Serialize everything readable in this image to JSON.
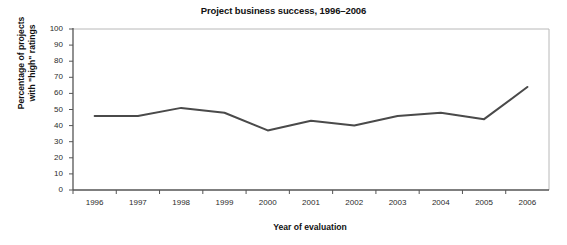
{
  "chart_data": {
    "type": "line",
    "title": "Project business success, 1996–2006",
    "xlabel": "Year of evaluation",
    "ylabel": "Percentage of projects\nwith \"high\" ratings",
    "x": [
      1996,
      1997,
      1998,
      1999,
      2000,
      2001,
      2002,
      2003,
      2004,
      2005,
      2006
    ],
    "categories": [
      "1996",
      "1997",
      "1998",
      "1999",
      "2000",
      "2001",
      "2002",
      "2003",
      "2004",
      "2005",
      "2006"
    ],
    "values": [
      46,
      46,
      51,
      48,
      37,
      43,
      40,
      46,
      48,
      44,
      64
    ],
    "series": [
      {
        "name": "Percentage of projects with \"high\" ratings",
        "values": [
          46,
          46,
          51,
          48,
          37,
          43,
          40,
          46,
          48,
          44,
          64
        ]
      }
    ],
    "ylim": [
      0,
      100
    ],
    "ytick_values": [
      0,
      10,
      20,
      30,
      40,
      50,
      60,
      70,
      80,
      90,
      100
    ],
    "ytick_labels": [
      "0",
      "10",
      "20",
      "30",
      "40",
      "50",
      "60",
      "70",
      "80",
      "90",
      "100"
    ],
    "xtick_labels": [
      "1996",
      "1997",
      "1998",
      "1999",
      "2000",
      "2001",
      "2002",
      "2003",
      "2004",
      "2005",
      "2006"
    ],
    "grid": false,
    "legend": null,
    "legend_position": "none",
    "line_color": "#4a4a4a",
    "line_width": 2,
    "axis_color": "#555555",
    "frame_color": "#b8b8b8",
    "background_color": "#ffffff"
  }
}
